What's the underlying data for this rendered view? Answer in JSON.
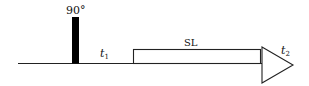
{
  "diagram": {
    "type": "pulse-sequence",
    "pulse": {
      "label": "90°",
      "color": "#000000"
    },
    "delays": [
      {
        "symbol": "t",
        "subscript": "1"
      },
      {
        "symbol": "t",
        "subscript": "2"
      }
    ],
    "spin_lock": {
      "label": "SL"
    },
    "acquisition": {
      "shape": "triangle"
    },
    "line_color": "#222222"
  }
}
